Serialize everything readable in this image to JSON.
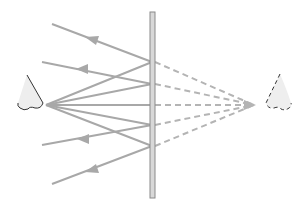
{
  "diagram": {
    "colors": {
      "background": "#ffffff",
      "ray": "#a8a8a8",
      "virtual_ray": "#b4b4b4",
      "mirror_fill": "#d8d8d8",
      "mirror_edge": "#8a8a8a",
      "eye_fill": "#eeeeee",
      "eye_outline": "#333333"
    },
    "mirror": {
      "x": 150,
      "y_top": 12,
      "y_bottom": 198,
      "width": 5
    },
    "eye_real": {
      "x": 46,
      "y": 105
    },
    "eye_virtual": {
      "x": 257,
      "y": 105
    },
    "reflection_points_y": [
      62,
      84,
      105,
      125,
      146
    ],
    "outgoing_rays": [
      {
        "from": [
          152,
          62
        ],
        "to": [
          52,
          24
        ]
      },
      {
        "from": [
          152,
          84
        ],
        "to": [
          42,
          62
        ]
      },
      {
        "from": [
          152,
          125
        ],
        "to": [
          42,
          145
        ]
      },
      {
        "from": [
          152,
          146
        ],
        "to": [
          52,
          184
        ]
      }
    ]
  }
}
